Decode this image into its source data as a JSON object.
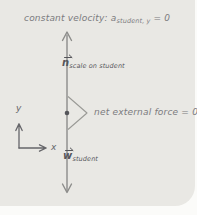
{
  "title": {
    "lead": "constant velocity: ",
    "symbol": "a",
    "subscript": "student, y",
    "tail": " = 0"
  },
  "forces": {
    "normal": {
      "symbol": "n",
      "subscript": "scale on student"
    },
    "weight": {
      "symbol": "w",
      "subscript": "student"
    }
  },
  "net_force": {
    "label": "net external force = 0"
  },
  "axes": {
    "x_label": "x",
    "y_label": "y"
  },
  "colors": {
    "page_bg": "#fbfbf9",
    "card_bg": "#e9e8e4",
    "ink": "#7b7b7e",
    "line": "#8c8c8a",
    "symbol_ink": "#55555a",
    "brace": "#9a9a96",
    "axis": "#66666a"
  }
}
